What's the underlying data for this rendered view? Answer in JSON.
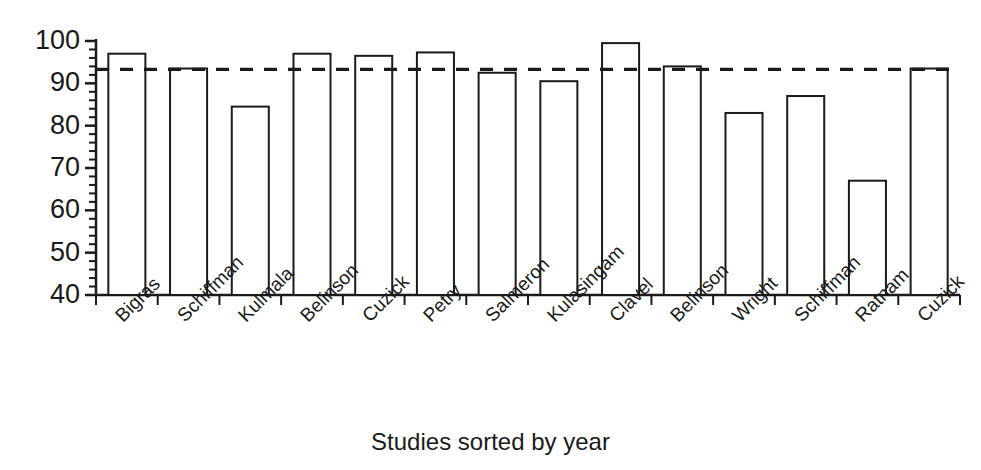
{
  "chart_data": {
    "type": "bar",
    "title": "",
    "subtitle": "",
    "xlabel": "Studies sorted by year",
    "ylabel": "",
    "ylim": [
      40,
      100
    ],
    "grid": false,
    "legend_position": "none",
    "y_major_ticks": [
      40,
      50,
      60,
      70,
      80,
      90,
      100
    ],
    "y_minor_tick_interval": 2,
    "x_tick_marks": true,
    "bar_style": {
      "fill": "#ffffff",
      "stroke": "#1a1a1a",
      "stroke_width": 2
    },
    "categories": [
      "Bigras",
      "Schiffman",
      "Kulmala",
      "Belinson",
      "Cuzick",
      "Petry",
      "Salmeron",
      "Kulasingam",
      "Clavel",
      "Belinson",
      "Wright",
      "Schiffman",
      "Ratnam",
      "Cuzick"
    ],
    "values": [
      97,
      93.5,
      84.5,
      97,
      96.5,
      97.3,
      92.5,
      90.5,
      99.5,
      94,
      83,
      87,
      67,
      93.5
    ],
    "annotations": [
      {
        "type": "reference-line",
        "name": "pooled-average-line",
        "style": "dashed",
        "orientation": "horizontal",
        "value": 93.3,
        "color": "#1a1a1a",
        "label": ""
      }
    ]
  },
  "axis": {
    "y_tick_labels": [
      "100",
      "90",
      "80",
      "70",
      "60",
      "50",
      "40"
    ],
    "x_axis_title": "Studies sorted by year"
  },
  "colors": {
    "ink": "#1a1a1a",
    "background": "#ffffff"
  }
}
